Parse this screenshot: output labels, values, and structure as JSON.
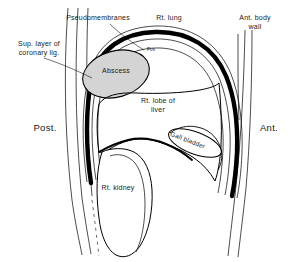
{
  "figure": {
    "width": 302,
    "height": 262,
    "background_color": "#ffffff",
    "line_color": "#000000",
    "thick_line_color": "#000000",
    "abscess_fill_color": "#d4d4d4",
    "label_text_color": "#1a1a1a"
  },
  "labels": {
    "pseudomembranes": "Pseudomembranes",
    "rt_lung": "Rt. lung",
    "ant_body_wall": "Ant. body\nwall",
    "sup_layer_coronary_lig": "Sup. layer of\ncoronary lig.",
    "abscess": "Abscess",
    "pus": "Pus",
    "rt_lobe_of_liver": "Rt. lobe of\nliver",
    "gall_bladder": "Gall bladder",
    "posterior": "Post.",
    "anterior": "Ant.",
    "rt_kidney": "Rt. kidney"
  },
  "structures": [
    {
      "name": "diaphragm",
      "style": "thick-black-arc"
    },
    {
      "name": "pseudomembranes",
      "style": "thin-parallel-lines"
    },
    {
      "name": "abscess-cavity",
      "style": "gray-filled-oval"
    },
    {
      "name": "right-lobe-of-liver",
      "style": "thin-outline"
    },
    {
      "name": "gall-bladder",
      "style": "thin-outline-oval"
    },
    {
      "name": "right-kidney",
      "style": "thin-outline"
    },
    {
      "name": "anterior-body-wall",
      "style": "thin-parallel-lines"
    },
    {
      "name": "posterior-body-wall",
      "style": "thin-parallel-lines"
    }
  ]
}
